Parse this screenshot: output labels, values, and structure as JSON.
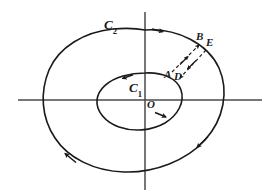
{
  "figure": {
    "kind": "phase-portrait-diagram",
    "background_color": "#ffffff",
    "stroke_color": "#1a1a1a",
    "axis_color": "#4a4a4a"
  },
  "axes": {
    "x_axis": {
      "name": "x-axis",
      "y": 100,
      "x_start": 18,
      "x_end": 262
    },
    "y_axis": {
      "name": "y-axis",
      "x": 145,
      "y_start": 12,
      "y_end": 190
    },
    "origin_label": "O",
    "origin_x": 145,
    "origin_y": 100
  },
  "curves": [
    {
      "id": "C2",
      "label_main": "C",
      "label_sub": "2",
      "role": "outer closed orbit",
      "orientation": "clockwise",
      "arrow_count": 3
    },
    {
      "id": "C1",
      "label_main": "C",
      "label_sub": "1",
      "role": "inner closed orbit",
      "orientation": "clockwise",
      "arrow_count": 2
    }
  ],
  "points": [
    {
      "id": "A",
      "label": "A",
      "x": 168,
      "y": 74
    },
    {
      "id": "D",
      "label": "D",
      "x": 178,
      "y": 76
    },
    {
      "id": "B",
      "label": "B",
      "x": 200,
      "y": 36
    },
    {
      "id": "E",
      "label": "E",
      "x": 210,
      "y": 42
    }
  ],
  "dashed_segments": [
    {
      "id": "A-to-B",
      "from": "A",
      "to": "B",
      "style": "dashed",
      "arrow_direction": "outward-up-right",
      "name": "dashed-trajectory-A-B"
    },
    {
      "id": "E-to-D",
      "from": "E",
      "to": "D",
      "style": "dashed",
      "arrow_direction": "inward-down-left",
      "name": "dashed-trajectory-E-D"
    }
  ]
}
